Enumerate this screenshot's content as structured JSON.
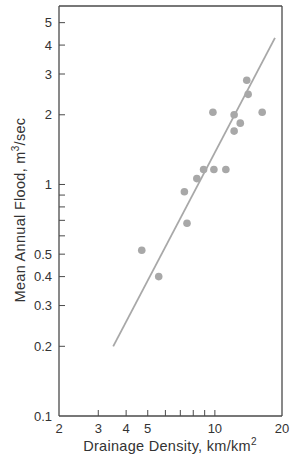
{
  "chart_data": {
    "type": "scatter",
    "title": "",
    "xlabel": "Drainage Density, km/km",
    "xlabel_sup": "2",
    "ylabel": "Mean Annual Flood, m",
    "ylabel_sup": "3",
    "ylabel_suffix": "/sec",
    "xscale": "log",
    "yscale": "log",
    "xlim": [
      2,
      20
    ],
    "ylim": [
      0.1,
      5.9
    ],
    "grid": false,
    "legend": null,
    "x_ticks": [
      {
        "value": 2,
        "label": "2"
      },
      {
        "value": 3,
        "label": "3"
      },
      {
        "value": 4,
        "label": "4"
      },
      {
        "value": 5,
        "label": "5"
      },
      {
        "value": 6,
        "label": ""
      },
      {
        "value": 7,
        "label": ""
      },
      {
        "value": 8,
        "label": ""
      },
      {
        "value": 9,
        "label": ""
      },
      {
        "value": 10,
        "label": "10"
      },
      {
        "value": 20,
        "label": "20"
      }
    ],
    "y_ticks": [
      {
        "value": 0.1,
        "label": "0.1"
      },
      {
        "value": 0.2,
        "label": "0.2"
      },
      {
        "value": 0.3,
        "label": "0.3"
      },
      {
        "value": 0.4,
        "label": "0.4"
      },
      {
        "value": 0.5,
        "label": "0.5"
      },
      {
        "value": 0.6,
        "label": ""
      },
      {
        "value": 0.7,
        "label": ""
      },
      {
        "value": 0.8,
        "label": ""
      },
      {
        "value": 0.9,
        "label": ""
      },
      {
        "value": 1,
        "label": "1"
      },
      {
        "value": 2,
        "label": "2"
      },
      {
        "value": 3,
        "label": "3"
      },
      {
        "value": 4,
        "label": "4"
      },
      {
        "value": 5,
        "label": "5"
      }
    ],
    "series": [
      {
        "name": "observations",
        "kind": "scatter",
        "color": "#a8a8a8",
        "points": [
          {
            "x": 4.7,
            "y": 0.52
          },
          {
            "x": 5.6,
            "y": 0.4
          },
          {
            "x": 7.3,
            "y": 0.93
          },
          {
            "x": 7.5,
            "y": 0.68
          },
          {
            "x": 8.3,
            "y": 1.06
          },
          {
            "x": 8.9,
            "y": 1.16
          },
          {
            "x": 9.9,
            "y": 1.16
          },
          {
            "x": 11.2,
            "y": 1.16
          },
          {
            "x": 9.8,
            "y": 2.05
          },
          {
            "x": 12.2,
            "y": 2.0
          },
          {
            "x": 12.2,
            "y": 1.7
          },
          {
            "x": 13.0,
            "y": 1.84
          },
          {
            "x": 13.9,
            "y": 2.82
          },
          {
            "x": 14.1,
            "y": 2.45
          },
          {
            "x": 16.3,
            "y": 2.05
          }
        ]
      },
      {
        "name": "regression line",
        "kind": "line",
        "color": "#a8a8a8",
        "points": [
          {
            "x": 3.5,
            "y": 0.2
          },
          {
            "x": 18.6,
            "y": 4.3
          }
        ]
      }
    ]
  },
  "plot_area": {
    "left": 59,
    "top": 6,
    "right": 282,
    "bottom": 416
  },
  "colors": {
    "axis": "#4a4a4a",
    "data": "#a8a8a8",
    "text": "#333333"
  }
}
